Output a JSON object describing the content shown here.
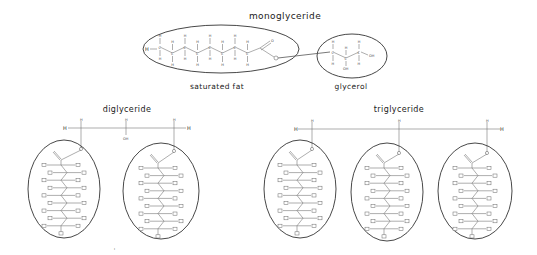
{
  "diagram": {
    "monoglyceride": {
      "title": "monoglyceride",
      "fat_label": "saturated fat",
      "glycerol_label": "glycerol",
      "chain_carbons": 9,
      "atoms": {
        "hydrogen": "H",
        "carbon": "C",
        "oxygen": "O",
        "hydroxyl": "OH"
      }
    },
    "diglyceride": {
      "title": "diglyceride",
      "backbone": {
        "left_h": "H",
        "right_h": "H",
        "top_h": "H",
        "middle_oh": "OH"
      },
      "fatty_acid_chains": 2
    },
    "triglyceride": {
      "title": "triglyceride",
      "backbone": {
        "left_h": "H",
        "right_h": "H",
        "top_h": "H"
      },
      "fatty_acid_chains": 3
    },
    "colors": {
      "line": "#333333",
      "background": "#ffffff",
      "text": "#1a1a1a"
    }
  }
}
